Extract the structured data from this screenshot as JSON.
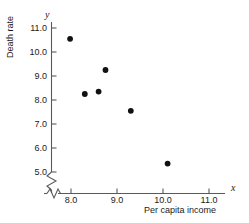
{
  "chart_data": {
    "type": "scatter",
    "title": "",
    "xlabel": "Per capita income",
    "ylabel": "Death rate",
    "x_axis_variable": "x",
    "y_axis_variable": "y",
    "xlim": [
      7.6,
      11.4
    ],
    "ylim": [
      4.7,
      11.35
    ],
    "x_ticks": [
      "8.0",
      "9.0",
      "10.0",
      "11.0"
    ],
    "x_tick_values": [
      8.0,
      9.0,
      10.0,
      11.0
    ],
    "y_ticks": [
      "11.0",
      "10.0",
      "9.0",
      "8.0",
      "7.0",
      "6.0",
      "5.0"
    ],
    "y_tick_values": [
      11.0,
      10.0,
      9.0,
      8.0,
      7.0,
      6.0,
      5.0
    ],
    "grid": false,
    "legend": false,
    "axis_break_x": true,
    "axis_break_y": true,
    "x": [
      7.98,
      8.3,
      8.6,
      8.75,
      9.3,
      10.1
    ],
    "y": [
      10.55,
      8.25,
      8.35,
      9.25,
      7.55,
      5.35
    ],
    "points": [
      {
        "x": 7.98,
        "y": 10.55
      },
      {
        "x": 8.3,
        "y": 8.25
      },
      {
        "x": 8.6,
        "y": 8.35
      },
      {
        "x": 8.75,
        "y": 9.25
      },
      {
        "x": 9.3,
        "y": 7.55
      },
      {
        "x": 10.1,
        "y": 5.35
      }
    ],
    "marker": "filled-circle",
    "marker_color": "#111111",
    "axis_color": "#5a5a5a"
  }
}
